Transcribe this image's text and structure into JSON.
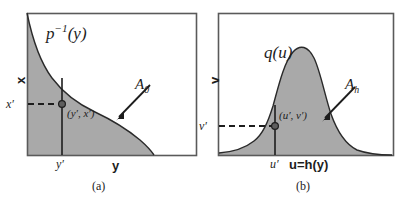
{
  "figure": {
    "type": "two-panel-math-diagram",
    "background_color": "#ffffff",
    "shade_color": "#a9a9a9",
    "line_color": "#1d1d1d",
    "frame_color": "#5a5a5a"
  },
  "panel_a": {
    "caption": "(a)",
    "curve_label": "p",
    "curve_label_sup": "−1",
    "curve_label_arg": "(y)",
    "region_label": "A",
    "region_label_sub": "0",
    "point_label": "(y′, x′)",
    "x_axis_label": "y",
    "y_axis_label": "x",
    "x_tick_label": "y′",
    "y_tick_label": "x′",
    "frame": {
      "left": 27,
      "top": 13,
      "right": 196,
      "bottom": 155
    },
    "point": {
      "x": 62,
      "y": 104
    },
    "curve_description": "monotonically decreasing inverse CDF curve from top-left to bottom-right",
    "curve_path": "M 27,13 C 33,42 40,62 52,78 C 64,94 78,104 95,112 C 112,120 128,130 140,140 C 148,147 152,152 154,155",
    "shade_path": "M 27,13 C 33,42 40,62 52,78 C 64,94 78,104 95,112 C 112,120 128,130 140,140 C 148,147 152,152 154,155 L 27,155 Z"
  },
  "panel_b": {
    "caption": "(b)",
    "curve_label": "q(u)",
    "region_label": "A",
    "region_label_sub": "h",
    "point_label": "(u′, v′)",
    "x_axis_label": "u=h(y)",
    "y_axis_label": "v",
    "x_tick_label": "u′",
    "y_tick_label": "v′",
    "frame": {
      "left": 218,
      "top": 13,
      "right": 393,
      "bottom": 155
    },
    "point": {
      "x": 275,
      "y": 126
    },
    "curve_description": "unimodal bell-shaped density curve peaking near the center",
    "curve_path": "M 219,153 C 232,152 244,149 254,141 C 263,134 268,122 273,106 C 278,88 284,62 293,52 C 300,44 308,46 314,58 C 320,70 325,96 331,114 C 337,131 345,144 357,150 C 368,154 382,155 392,155",
    "shade_path": "M 219,153 C 232,152 244,149 254,141 C 263,134 268,122 273,106 C 278,88 284,62 293,52 C 300,44 308,46 314,58 C 320,70 325,96 331,114 C 337,131 345,144 357,150 C 368,154 382,155 392,155 L 392,155 L 219,155 Z"
  }
}
